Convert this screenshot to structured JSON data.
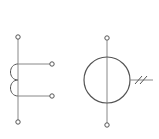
{
  "diagram": {
    "symbols": [
      {
        "name": "tapped inductor coil",
        "terminals": 4
      },
      {
        "name": "circle source with vertical terminals and double-slash lead",
        "terminals": 2
      }
    ],
    "colors": {
      "line": "#555555",
      "background": "#ffffff"
    }
  }
}
